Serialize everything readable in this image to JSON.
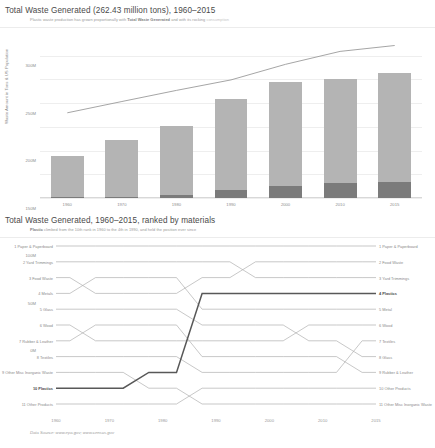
{
  "charts": {
    "bar": {
      "title": "Total Waste Generated (262.43 million tons), 1960–2015",
      "subtitle_a": "Plastic waste production has grown proportionally with ",
      "subtitle_b": "Total Waste Generated",
      "subtitle_c": " and with its rocking ",
      "subtitle_d": "consumption"
    },
    "bump": {
      "title": "Total Waste Generated, 1960–2015, ranked by materials",
      "subtitle_a": "Plastic ",
      "subtitle_b": "climbed from the 10th rank in 1960 to the 4th in 1990, and held the position ever since"
    }
  },
  "footer": {
    "source": "Data Source: www.epa.gov; www.census.gov"
  },
  "chart_data": [
    {
      "type": "bar",
      "title": "Total Waste Generated (262.43 million tons), 1960–2015",
      "xlabel": "",
      "ylabel": "Waste Amount in Tons & US Population",
      "categories": [
        "1960",
        "1970",
        "1980",
        "1990",
        "2000",
        "2010",
        "2015"
      ],
      "ylim": [
        0,
        320
      ],
      "ytick_labels": [
        "0M",
        "50M",
        "100M",
        "150M",
        "200M",
        "250M",
        "300M"
      ],
      "ytick_values": [
        0,
        50,
        100,
        150,
        200,
        250,
        300
      ],
      "grid": true,
      "legend": "none",
      "unit": "million tons",
      "series": [
        {
          "name": "Total Waste Generated",
          "color": "#b4b4b4",
          "values": [
            88.1,
            121.1,
            151.6,
            208.3,
            243.5,
            251.1,
            262.43
          ]
        },
        {
          "name": "Plastics Waste",
          "color": "#7b7b7b",
          "values": [
            0.39,
            2.9,
            6.8,
            17.1,
            25.5,
            31.4,
            34.5
          ]
        }
      ],
      "overlay_line": {
        "name": "US Population",
        "color": "#9b9b9b",
        "values": [
          179.3,
          203.2,
          226.5,
          248.7,
          281.4,
          308.7,
          321.0
        ]
      }
    },
    {
      "type": "line",
      "subtype": "bump",
      "title": "Total Waste Generated, 1960–2015, ranked by materials",
      "xlabel": "",
      "ylabel": "Rank",
      "x": [
        "1960",
        "1970",
        "1980",
        "1990",
        "2000",
        "2010",
        "2015"
      ],
      "ylim": [
        11,
        1
      ],
      "inverted_y": true,
      "grid": false,
      "legend": "inline-labels",
      "labels_left": [
        "1 Paper & Paperboard",
        "2 Yard Trimmings",
        "3 Food Waste",
        "4 Metals",
        "5 Glass",
        "6 Wood",
        "7 Rubber & Leather",
        "8 Textiles",
        "9 Other Misc Inorganic Waste",
        "10 Plastics",
        "11 Other Products"
      ],
      "labels_right": [
        "1 Paper & Paperboard",
        "2 Food Waste",
        "3 Yard Trimmings",
        "4 Plastics",
        "5 Metal",
        "6 Wood",
        "7 Textiles",
        "8 Glass",
        "9 Rubber & Leather",
        "10 Other Products",
        "11 Other Misc Inorganic Waste"
      ],
      "series": [
        {
          "name": "Paper & Paperboard",
          "color": "#b0b0b0",
          "highlight": false,
          "ranks": [
            1,
            1,
            1,
            1,
            1,
            1,
            1
          ]
        },
        {
          "name": "Yard Trimmings",
          "color": "#b0b0b0",
          "highlight": false,
          "ranks": [
            2,
            2,
            2,
            2,
            3,
            3,
            3
          ]
        },
        {
          "name": "Food Waste",
          "color": "#b0b0b0",
          "highlight": false,
          "ranks": [
            3,
            4,
            4,
            3,
            2,
            2,
            2
          ]
        },
        {
          "name": "Metal",
          "color": "#b0b0b0",
          "highlight": false,
          "ranks": [
            4,
            3,
            3,
            5,
            5,
            5,
            5
          ]
        },
        {
          "name": "Glass",
          "color": "#b0b0b0",
          "highlight": false,
          "ranks": [
            5,
            5,
            5,
            6,
            6,
            7,
            8
          ]
        },
        {
          "name": "Wood",
          "color": "#b0b0b0",
          "highlight": false,
          "ranks": [
            6,
            7,
            7,
            7,
            7,
            6,
            6
          ]
        },
        {
          "name": "Rubber & Leather",
          "color": "#b0b0b0",
          "highlight": false,
          "ranks": [
            7,
            6,
            6,
            8,
            8,
            8,
            9
          ]
        },
        {
          "name": "Textiles",
          "color": "#b0b0b0",
          "highlight": false,
          "ranks": [
            8,
            8,
            8,
            9,
            9,
            9,
            7
          ]
        },
        {
          "name": "Other Misc Inorganic Waste",
          "color": "#b0b0b0",
          "highlight": false,
          "ranks": [
            9,
            9,
            10,
            11,
            11,
            11,
            11
          ]
        },
        {
          "name": "Plastics",
          "color": "#585858",
          "highlight": true,
          "ranks": [
            10,
            10,
            9,
            4,
            4,
            4,
            4
          ]
        },
        {
          "name": "Other Products",
          "color": "#b0b0b0",
          "highlight": false,
          "ranks": [
            11,
            11,
            11,
            10,
            10,
            10,
            10
          ]
        }
      ]
    }
  ]
}
